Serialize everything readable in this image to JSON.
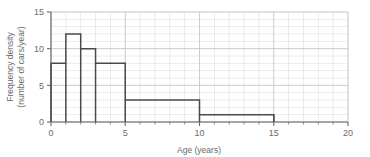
{
  "chart_data": {
    "type": "bar",
    "title": "",
    "subtitle": "",
    "xlabel": "Age (years)",
    "ylabel": "Frequency density\n(number of cars/year)",
    "ylabel_line1": "Frequency density",
    "ylabel_line2": "(number of cars/year)",
    "xlim": [
      0,
      20
    ],
    "ylim": [
      0,
      15
    ],
    "xticks": [
      0,
      5,
      10,
      15,
      20
    ],
    "xtick_labels": [
      "0",
      "5",
      "10",
      "15",
      "20"
    ],
    "xminor_step": 1,
    "yticks": [
      0,
      5,
      10,
      15
    ],
    "ytick_labels": [
      "0",
      "5",
      "10",
      "15"
    ],
    "yminor_step": 1,
    "grid": true,
    "grid_color": "#c9c9c9",
    "legend": null,
    "bar_edge_color": "#4a4a4a",
    "bar_fill": "none",
    "bins": [
      {
        "x_start": 0,
        "x_end": 1,
        "height": 8
      },
      {
        "x_start": 1,
        "x_end": 2,
        "height": 12
      },
      {
        "x_start": 2,
        "x_end": 3,
        "height": 10
      },
      {
        "x_start": 3,
        "x_end": 5,
        "height": 8
      },
      {
        "x_start": 5,
        "x_end": 10,
        "height": 3
      },
      {
        "x_start": 10,
        "x_end": 15,
        "height": 1
      }
    ],
    "categories": [
      "0-1",
      "1-2",
      "2-3",
      "3-5",
      "5-10",
      "10-15"
    ],
    "values": [
      8,
      12,
      10,
      8,
      3,
      1
    ]
  },
  "colors": {
    "background": "#ffffff",
    "axis": "#6b6b6b",
    "grid": "#c9c9c9",
    "bar_outline": "#4a4a4a",
    "text": "#6b6b6b"
  }
}
